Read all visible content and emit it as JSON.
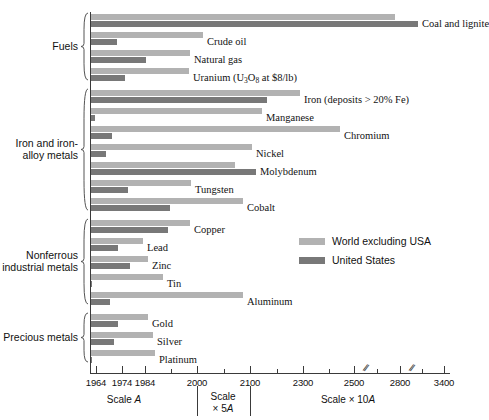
{
  "chart_data": {
    "type": "bar",
    "orientation": "horizontal",
    "title": "",
    "xlabel": "Year of exhaustion",
    "ylabel": "",
    "grid": false,
    "legend_position": "middle-right",
    "legend": [
      {
        "name": "World excluding USA",
        "color": "#b2b2b2"
      },
      {
        "name": "United States",
        "color": "#787878"
      }
    ],
    "axis": {
      "baseline_value": 1964,
      "ticks": [
        {
          "label": "1964",
          "x": 96,
          "major": true
        },
        {
          "label": "1974",
          "x": 122,
          "major": true
        },
        {
          "label": "1984",
          "x": 145,
          "major": true
        },
        {
          "label": "",
          "x": 171,
          "major": false
        },
        {
          "label": "2000",
          "x": 197,
          "major": true
        },
        {
          "label": "",
          "x": 224,
          "major": false
        },
        {
          "label": "2100",
          "x": 250,
          "major": true
        },
        {
          "label": "",
          "x": 277,
          "major": false
        },
        {
          "label": "2300",
          "x": 303,
          "major": true
        },
        {
          "label": "",
          "x": 329,
          "major": false
        },
        {
          "label": "2500",
          "x": 354,
          "major": true
        },
        {
          "label": "",
          "x": 377,
          "major": false
        },
        {
          "label": "2800",
          "x": 400,
          "major": true
        },
        {
          "label": "",
          "x": 422,
          "major": false
        },
        {
          "label": "3400",
          "x": 444,
          "major": true
        }
      ],
      "breaks": [
        {
          "x": 364
        },
        {
          "x": 410
        }
      ],
      "scale_captions": [
        {
          "text": "Scale A",
          "x": 124,
          "y": 394
        },
        {
          "text": "Scale\n× 5A",
          "x": 223,
          "y": 391
        },
        {
          "text": "Scale × 10A",
          "x": 348,
          "y": 394
        }
      ]
    },
    "groups": [
      {
        "name": "Fuels",
        "label": "Fuels",
        "items": [
          {
            "name": "Coal and lignite",
            "label": "Coal and lignite",
            "world": {
              "end_px": 395,
              "value": 2800
            },
            "usa": {
              "end_px": 418,
              "value": 3100
            }
          },
          {
            "name": "Crude oil",
            "label": "Crude oil",
            "world": {
              "end_px": 203,
              "value": 2010
            },
            "usa": {
              "end_px": 117,
              "value": 1972
            }
          },
          {
            "name": "Natural gas",
            "label": "Natural gas",
            "world": {
              "end_px": 190,
              "value": 2000
            },
            "usa": {
              "end_px": 146,
              "value": 1984
            }
          },
          {
            "name": "Uranium",
            "label": "Uranium (U3O8 at $8/lb)",
            "world": {
              "end_px": 189,
              "value": 2000
            },
            "usa": {
              "end_px": 125,
              "value": 1976
            }
          }
        ]
      },
      {
        "name": "Iron and iron-alloy metals",
        "label": "Iron and iron-\nalloy metals",
        "items": [
          {
            "name": "Iron",
            "label": "Iron (deposits > 20% Fe)",
            "world": {
              "end_px": 300,
              "value": 2290
            },
            "usa": {
              "end_px": 267,
              "value": 2160
            }
          },
          {
            "name": "Manganese",
            "label": "Manganese",
            "world": {
              "end_px": 262,
              "value": 2145
            },
            "usa": {
              "end_px": 95,
              "value": 1965
            }
          },
          {
            "name": "Chromium",
            "label": "Chromium",
            "world": {
              "end_px": 340,
              "value": 2450
            },
            "usa": {
              "end_px": 112,
              "value": 1971
            }
          },
          {
            "name": "Nickel",
            "label": "Nickel",
            "world": {
              "end_px": 252,
              "value": 2110
            },
            "usa": {
              "end_px": 106,
              "value": 1969
            }
          },
          {
            "name": "Molybdenum",
            "label": "Molybdenum",
            "world": {
              "end_px": 235,
              "value": 2065
            },
            "usa": {
              "end_px": 256,
              "value": 2120
            }
          },
          {
            "name": "Tungsten",
            "label": "Tungsten",
            "world": {
              "end_px": 191,
              "value": 2000
            },
            "usa": {
              "end_px": 128,
              "value": 1978
            }
          },
          {
            "name": "Cobalt",
            "label": "Cobalt",
            "world": {
              "end_px": 243,
              "value": 2090
            },
            "usa": {
              "end_px": 170,
              "value": 1996
            }
          }
        ]
      },
      {
        "name": "Nonferrous industrial metals",
        "label": "Nonferrous\nindustrial metals",
        "items": [
          {
            "name": "Copper",
            "label": "Copper",
            "world": {
              "end_px": 190,
              "value": 2000
            },
            "usa": {
              "end_px": 168,
              "value": 1995
            }
          },
          {
            "name": "Lead",
            "label": "Lead",
            "world": {
              "end_px": 143,
              "value": 1983
            },
            "usa": {
              "end_px": 118,
              "value": 1973
            }
          },
          {
            "name": "Zinc",
            "label": "Zinc",
            "world": {
              "end_px": 148,
              "value": 1985
            },
            "usa": {
              "end_px": 130,
              "value": 1978
            }
          },
          {
            "name": "Tin",
            "label": "Tin",
            "world": {
              "end_px": 163,
              "value": 1992
            },
            "usa": {
              "end_px": 92,
              "value": 1964
            }
          },
          {
            "name": "Aluminum",
            "label": "Aluminum",
            "world": {
              "end_px": 243,
              "value": 2090
            },
            "usa": {
              "end_px": 110,
              "value": 1970
            }
          }
        ]
      },
      {
        "name": "Precious metals",
        "label": "Precious metals",
        "items": [
          {
            "name": "Gold",
            "label": "Gold",
            "world": {
              "end_px": 148,
              "value": 1985
            },
            "usa": {
              "end_px": 118,
              "value": 1973
            }
          },
          {
            "name": "Silver",
            "label": "Silver",
            "world": {
              "end_px": 153,
              "value": 1988
            },
            "usa": {
              "end_px": 114,
              "value": 1972
            }
          },
          {
            "name": "Platinum",
            "label": "Platinum",
            "world": {
              "end_px": 155,
              "value": 1989
            },
            "usa": {
              "end_px": 92,
              "value": 1964
            }
          }
        ]
      }
    ]
  },
  "colors": {
    "world": "#b2b2b2",
    "usa": "#787878",
    "axis": "#3a3a3a",
    "text": "#111111"
  }
}
